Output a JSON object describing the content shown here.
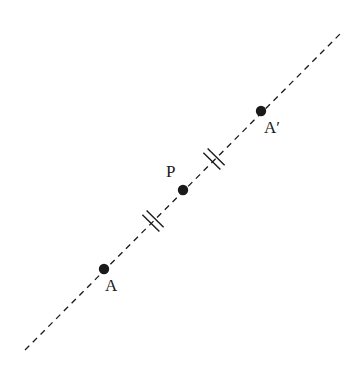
{
  "diagram": {
    "type": "point-reflection",
    "colors": {
      "stroke": "#1a1a1a",
      "background": "#ffffff"
    },
    "line": {
      "x1": 25,
      "y1": 350,
      "x2": 343,
      "y2": 31,
      "style": "dashed"
    },
    "points": [
      {
        "id": "A",
        "label": "A",
        "x": 104,
        "y": 269,
        "label_x": 105,
        "label_y": 291
      },
      {
        "id": "P",
        "label": "P",
        "x": 183,
        "y": 190,
        "label_x": 166,
        "label_y": 177
      },
      {
        "id": "A_prime",
        "label": "A′",
        "x": 261,
        "y": 111,
        "label_x": 264,
        "label_y": 133
      }
    ],
    "tick_marks": [
      {
        "between": "A-P",
        "x": 153,
        "y": 221,
        "count": 2
      },
      {
        "between": "P-A′",
        "x": 214,
        "y": 159,
        "count": 2
      }
    ]
  }
}
